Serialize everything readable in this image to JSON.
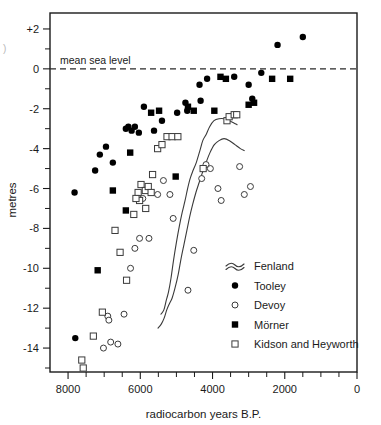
{
  "figure": {
    "corner_mark": ")",
    "msl_annotation": "mean sea level"
  },
  "chart_data": {
    "type": "scatter",
    "title": "",
    "xlabel": "radiocarbon years B.P.",
    "ylabel": "metres",
    "xlim": [
      8500,
      0
    ],
    "ylim": [
      -15.2,
      2.8
    ],
    "x_reversed": true,
    "grid": false,
    "legend_position": "bottom-right",
    "xticks_major": [
      8000,
      6000,
      4000,
      2000,
      0
    ],
    "xticklabels": [
      "8000",
      "6000",
      "4000",
      "2000",
      "0"
    ],
    "xticks_minor": [
      7500,
      7000,
      6500,
      5500,
      5000,
      4500,
      3500,
      3000,
      2500,
      1500,
      1000,
      500
    ],
    "yticks_major": [
      2,
      0,
      -2,
      -4,
      -6,
      -8,
      -10,
      -12,
      -14
    ],
    "yticklabels": [
      "+2",
      "0",
      "-2",
      "-4",
      "-6",
      "-8",
      "-10",
      "-12",
      "-14"
    ],
    "yticks_minor": [
      1,
      -1,
      -3,
      -5,
      -7,
      -9,
      -11,
      -13,
      -15
    ],
    "reference_lines": [
      {
        "name": "mean sea level",
        "y": 0,
        "style": "dashed",
        "label": "mean sea level"
      }
    ],
    "series": [
      {
        "name": "Fenland",
        "marker": "band-lines",
        "type": "line",
        "description": "two sub-parallel envelope curves",
        "upper": [
          [
            5430,
            -12.3
          ],
          [
            5350,
            -12.1
          ],
          [
            5280,
            -11.6
          ],
          [
            5220,
            -11.2
          ],
          [
            5150,
            -10.5
          ],
          [
            5080,
            -9.6
          ],
          [
            5000,
            -8.7
          ],
          [
            4920,
            -7.9
          ],
          [
            4840,
            -7.2
          ],
          [
            4760,
            -6.6
          ],
          [
            4690,
            -6.0
          ],
          [
            4620,
            -5.5
          ],
          [
            4540,
            -5.1
          ],
          [
            4450,
            -4.7
          ],
          [
            4350,
            -4.1
          ],
          [
            4270,
            -3.6
          ],
          [
            4180,
            -3.3
          ],
          [
            4080,
            -2.9
          ],
          [
            3960,
            -2.6
          ],
          [
            3820,
            -2.5
          ],
          [
            3680,
            -2.5
          ],
          [
            3540,
            -2.6
          ],
          [
            3420,
            -2.7
          ],
          [
            3320,
            -2.8
          ]
        ],
        "lower": [
          [
            5510,
            -13.0
          ],
          [
            5420,
            -12.8
          ],
          [
            5340,
            -12.5
          ],
          [
            5270,
            -12.1
          ],
          [
            5200,
            -11.8
          ],
          [
            5120,
            -11.5
          ],
          [
            5040,
            -11.0
          ],
          [
            4950,
            -10.3
          ],
          [
            4870,
            -9.5
          ],
          [
            4790,
            -8.8
          ],
          [
            4710,
            -8.1
          ],
          [
            4630,
            -7.4
          ],
          [
            4550,
            -6.8
          ],
          [
            4460,
            -6.2
          ],
          [
            4370,
            -5.7
          ],
          [
            4280,
            -5.2
          ],
          [
            4180,
            -4.7
          ],
          [
            4070,
            -4.2
          ],
          [
            3950,
            -3.8
          ],
          [
            3820,
            -3.6
          ],
          [
            3680,
            -3.5
          ],
          [
            3530,
            -3.6
          ],
          [
            3380,
            -3.8
          ],
          [
            3230,
            -4.0
          ],
          [
            3120,
            -4.1
          ]
        ]
      },
      {
        "name": "Tooley",
        "marker": "filled-circle",
        "type": "scatter",
        "points": [
          [
            7820,
            -6.2
          ],
          [
            7800,
            -13.5
          ],
          [
            7250,
            -5.1
          ],
          [
            7120,
            -4.3
          ],
          [
            6950,
            -3.9
          ],
          [
            6760,
            -4.7
          ],
          [
            6400,
            -3.0
          ],
          [
            6330,
            -2.9
          ],
          [
            6240,
            -3.1
          ],
          [
            6150,
            -2.9
          ],
          [
            6040,
            -3.2
          ],
          [
            5900,
            -1.9
          ],
          [
            5620,
            -3.1
          ],
          [
            5400,
            -2.6
          ],
          [
            4980,
            -2.2
          ],
          [
            4750,
            -1.7
          ],
          [
            4700,
            -2.1
          ],
          [
            4360,
            -0.8
          ],
          [
            4330,
            -1.6
          ],
          [
            4150,
            -0.5
          ],
          [
            3000,
            -0.8
          ],
          [
            2900,
            -1.5
          ],
          [
            2200,
            1.2
          ],
          [
            1500,
            1.6
          ],
          [
            2650,
            -0.2
          ],
          [
            3400,
            -0.4
          ]
        ]
      },
      {
        "name": "Devoy",
        "marker": "open-circle",
        "type": "scatter",
        "points": [
          [
            7020,
            -14.0
          ],
          [
            6900,
            -12.4
          ],
          [
            6870,
            -12.6
          ],
          [
            6820,
            -13.7
          ],
          [
            6620,
            -13.8
          ],
          [
            6450,
            -12.3
          ],
          [
            6270,
            -10.0
          ],
          [
            6150,
            -9.0
          ],
          [
            6020,
            -8.5
          ],
          [
            5930,
            -6.5
          ],
          [
            5760,
            -8.5
          ],
          [
            5520,
            -6.3
          ],
          [
            5360,
            -5.6
          ],
          [
            5180,
            -6.3
          ],
          [
            5090,
            -7.5
          ],
          [
            4680,
            -11.1
          ],
          [
            4520,
            -9.1
          ],
          [
            4300,
            -5.5
          ],
          [
            4180,
            -4.8
          ],
          [
            4060,
            -5.0
          ],
          [
            3850,
            -6.0
          ],
          [
            3760,
            -6.6
          ],
          [
            3250,
            -4.9
          ],
          [
            3120,
            -6.3
          ],
          [
            2950,
            -5.9
          ]
        ]
      },
      {
        "name": "Mörner",
        "marker": "filled-square",
        "type": "scatter",
        "points": [
          [
            7180,
            -10.1
          ],
          [
            6760,
            -6.1
          ],
          [
            6400,
            -7.1
          ],
          [
            6280,
            -4.2
          ],
          [
            5700,
            -2.2
          ],
          [
            5480,
            -2.1
          ],
          [
            5020,
            -5.4
          ],
          [
            4680,
            -1.9
          ],
          [
            4520,
            -2.1
          ],
          [
            3950,
            -2.1
          ],
          [
            3780,
            -0.4
          ],
          [
            3630,
            -0.5
          ],
          [
            3000,
            -1.8
          ],
          [
            2850,
            -1.7
          ],
          [
            2350,
            -0.5
          ],
          [
            1850,
            -0.5
          ]
        ]
      },
      {
        "name": "Kidson and Heyworth",
        "marker": "open-square",
        "type": "scatter",
        "points": [
          [
            7620,
            -14.6
          ],
          [
            7580,
            -15.0
          ],
          [
            7300,
            -13.4
          ],
          [
            7050,
            -12.2
          ],
          [
            6700,
            -8.1
          ],
          [
            6560,
            -9.2
          ],
          [
            6380,
            -10.6
          ],
          [
            6180,
            -7.3
          ],
          [
            6060,
            -6.2
          ],
          [
            6020,
            -6.6
          ],
          [
            5980,
            -5.8
          ],
          [
            5860,
            -6.1
          ],
          [
            5780,
            -5.9
          ],
          [
            5700,
            -6.2
          ],
          [
            5660,
            -5.3
          ],
          [
            5520,
            -4.0
          ],
          [
            5400,
            -3.8
          ],
          [
            5260,
            -3.4
          ],
          [
            5120,
            -3.4
          ],
          [
            4960,
            -3.4
          ],
          [
            4260,
            -5.0
          ],
          [
            3600,
            -2.6
          ],
          [
            3540,
            -2.4
          ],
          [
            3400,
            -2.3
          ],
          [
            3330,
            -2.3
          ],
          [
            6120,
            -6.5
          ],
          [
            5850,
            -7.0
          ]
        ]
      }
    ]
  },
  "legend": {
    "entries": [
      {
        "label": "Fenland",
        "marker": "band-lines"
      },
      {
        "label": "Tooley",
        "marker": "filled-circle"
      },
      {
        "label": "Devoy",
        "marker": "open-circle"
      },
      {
        "label": "Mörner",
        "marker": "filled-square"
      },
      {
        "label": "Kidson and Heyworth",
        "marker": "open-square"
      }
    ]
  }
}
